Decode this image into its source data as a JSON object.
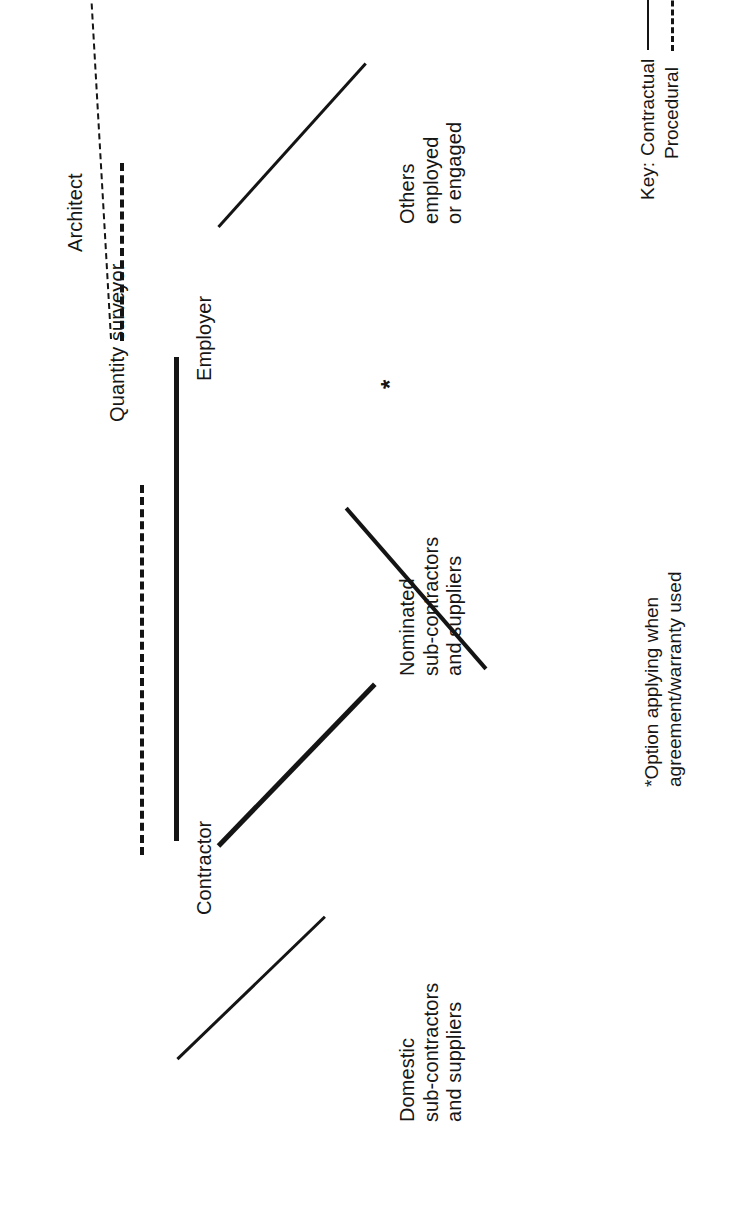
{
  "figure": {
    "orientation": "rotated-90-ccw",
    "line_color": "#141414",
    "background_color": "#ffffff"
  },
  "nodes": {
    "architect": {
      "label": "Architect"
    },
    "quantity_surveyor": {
      "label": "Quantity surveyor"
    },
    "employer": {
      "label": "Employer"
    },
    "contractor": {
      "label": "Contractor"
    },
    "domestic": {
      "label": "Domestic\nsub-contractors\nand suppliers"
    },
    "nominated": {
      "label": "Nominated\nsub-contractors\nand suppliers"
    },
    "others": {
      "label": "Others\nemployed\nor engaged"
    }
  },
  "edges": [
    {
      "from": "architect",
      "to": "employer",
      "type": "procedural",
      "style": "dashed"
    },
    {
      "from": "quantity_surveyor",
      "to": "contractor",
      "type": "procedural",
      "style": "dashed"
    },
    {
      "from": "architect",
      "to": "contractor",
      "type": "procedural",
      "style": "dashed"
    },
    {
      "from": "employer",
      "to": "contractor",
      "type": "contractual",
      "style": "solid"
    },
    {
      "from": "employer",
      "to": "nominated",
      "type": "contractual",
      "style": "solid",
      "marker": "*"
    },
    {
      "from": "employer",
      "to": "others",
      "type": "contractual",
      "style": "solid"
    },
    {
      "from": "contractor",
      "to": "nominated",
      "type": "contractual",
      "style": "solid"
    },
    {
      "from": "contractor",
      "to": "domestic",
      "type": "contractual",
      "style": "solid"
    }
  ],
  "markers": {
    "option_star": "*"
  },
  "footnote": {
    "text": "*Option applying when\nagreement/warranty used"
  },
  "key": {
    "title": "Key:",
    "entries": [
      {
        "label": "Contractual",
        "style": "solid"
      },
      {
        "label": "Procedural",
        "style": "dashed"
      }
    ]
  }
}
